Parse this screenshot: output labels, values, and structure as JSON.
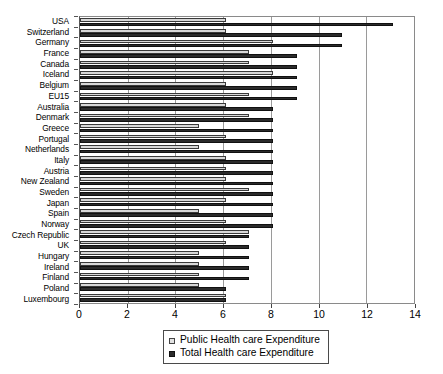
{
  "chart_data": {
    "type": "bar",
    "orientation": "horizontal",
    "title": "",
    "subtitle": "",
    "xlabel": "",
    "ylabel": "",
    "xlim": [
      0,
      14
    ],
    "xticks": [
      0,
      2,
      4,
      6,
      8,
      10,
      12,
      14
    ],
    "xtick_labels": [
      "0",
      "2",
      "4",
      "6",
      "8",
      "10",
      "12",
      "14"
    ],
    "grid": true,
    "grid_axis": "x",
    "legend_position": "bottom-center",
    "categories": [
      "USA",
      "Switzerland",
      "Germany",
      "France",
      "Canada",
      "Iceland",
      "Belgium",
      "EU15",
      "Australia",
      "Denmark",
      "Greece",
      "Portugal",
      "Netherlands",
      "Italy",
      "Austria",
      "New Zealand",
      "Sweden",
      "Japan",
      "Spain",
      "Norway",
      "Czech Republic",
      "UK",
      "Hungary",
      "Ireland",
      "Finland",
      "Poland",
      "Luxembourg"
    ],
    "series": [
      {
        "name": "Public Health care Expenditure",
        "color": "#d8d8d8",
        "values": [
          6.1,
          6.1,
          8.1,
          7.1,
          7.1,
          8.1,
          6.1,
          7.1,
          6.1,
          7.1,
          5.0,
          6.1,
          5.0,
          6.1,
          6.1,
          6.1,
          7.1,
          6.1,
          5.0,
          6.1,
          7.1,
          6.1,
          5.0,
          5.0,
          5.0,
          5.0,
          6.1
        ]
      },
      {
        "name": "Total Health care Expenditure",
        "color": "#2b2b2b",
        "values": [
          13.1,
          11.0,
          11.0,
          9.1,
          9.1,
          9.1,
          9.1,
          9.1,
          8.1,
          8.1,
          8.1,
          8.1,
          8.1,
          8.1,
          8.1,
          8.1,
          8.1,
          8.1,
          8.1,
          8.1,
          7.1,
          7.1,
          7.1,
          7.1,
          7.1,
          6.1,
          6.1
        ]
      }
    ]
  },
  "legend": {
    "items": [
      {
        "label": "Public Health care Expenditure",
        "swatch": "public-swatch"
      },
      {
        "label": "Total Health care Expenditure",
        "swatch": "total-swatch"
      }
    ]
  }
}
